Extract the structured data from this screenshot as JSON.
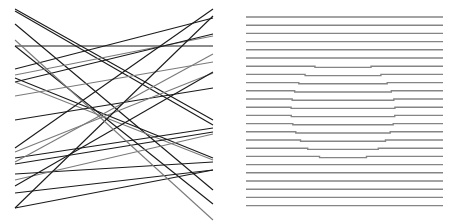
{
  "figure": {
    "width": 459,
    "height": 223,
    "background": "#ffffff",
    "panels": [
      {
        "name": "random-lines-panel",
        "stroke_colors": [
          "#1a1a1a",
          "#7a7a7a"
        ],
        "stroke_width": 1.1,
        "lines": [
          [
            15,
            9,
            213,
            120,
            "#1a1a1a"
          ],
          [
            15,
            11,
            213,
            125,
            "#1a1a1a"
          ],
          [
            15,
            24,
            213,
            190,
            "#1a1a1a"
          ],
          [
            15,
            46,
            213,
            46,
            "#1a1a1a"
          ],
          [
            15,
            46,
            213,
            204,
            "#1a1a1a"
          ],
          [
            15,
            69,
            213,
            18,
            "#1a1a1a"
          ],
          [
            15,
            75,
            213,
            36,
            "#7a7a7a"
          ],
          [
            15,
            78,
            213,
            158,
            "#1a1a1a"
          ],
          [
            15,
            82,
            213,
            34,
            "#1a1a1a"
          ],
          [
            15,
            82,
            213,
            160,
            "#7a7a7a"
          ],
          [
            15,
            96,
            213,
            62,
            "#7a7a7a"
          ],
          [
            15,
            120,
            213,
            88,
            "#1a1a1a"
          ],
          [
            15,
            148,
            213,
            9,
            "#1a1a1a"
          ],
          [
            15,
            152,
            213,
            73,
            "#7a7a7a"
          ],
          [
            15,
            158,
            213,
            128,
            "#1a1a1a"
          ],
          [
            15,
            162,
            213,
            54,
            "#7a7a7a"
          ],
          [
            15,
            164,
            213,
            132,
            "#1a1a1a"
          ],
          [
            15,
            174,
            213,
            162,
            "#1a1a1a"
          ],
          [
            15,
            180,
            213,
            134,
            "#7a7a7a"
          ],
          [
            15,
            193,
            213,
            170,
            "#1a1a1a"
          ],
          [
            15,
            208,
            213,
            16,
            "#1a1a1a"
          ],
          [
            15,
            208,
            213,
            170,
            "#1a1a1a"
          ],
          [
            15,
            186,
            213,
            72,
            "#1a1a1a"
          ],
          [
            15,
            40,
            213,
            220,
            "#7a7a7a"
          ]
        ]
      },
      {
        "name": "horizontal-lines-panel",
        "stroke_color": "#858585",
        "stroke_width": 1.4,
        "x_start": 246,
        "x_end": 443,
        "y_start": 17,
        "spacing": 8.2,
        "count": 24,
        "hidden_circle": {
          "cx": 343,
          "cy": 110,
          "r": 52,
          "offset": 1.2
        }
      }
    ]
  }
}
